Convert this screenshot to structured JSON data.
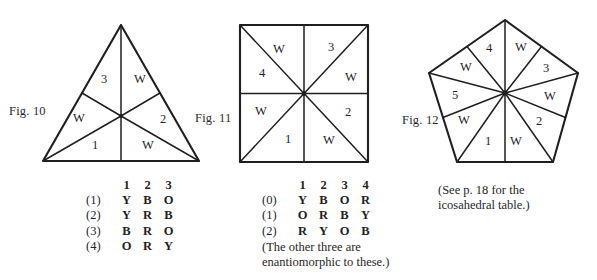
{
  "figures": {
    "fig10": {
      "label": "Fig. 10",
      "shape": "triangle",
      "cells": [
        "3",
        "W",
        "2",
        "W",
        "1",
        "W"
      ],
      "cell_positions": [
        {
          "text": "3",
          "x": 104,
          "y": 80
        },
        {
          "text": "W",
          "x": 140,
          "y": 80
        },
        {
          "text": "2",
          "x": 163,
          "y": 120
        },
        {
          "text": "W",
          "x": 148,
          "y": 146
        },
        {
          "text": "1",
          "x": 95,
          "y": 146
        },
        {
          "text": "W",
          "x": 79,
          "y": 119
        }
      ]
    },
    "fig11": {
      "label": "Fig. 11",
      "shape": "square",
      "cells": [
        "W",
        "3",
        "W",
        "2",
        "W",
        "1",
        "W",
        "4"
      ],
      "cell_positions": [
        {
          "text": "W",
          "x": 279,
          "y": 50
        },
        {
          "text": "3",
          "x": 331,
          "y": 48
        },
        {
          "text": "W",
          "x": 351,
          "y": 78
        },
        {
          "text": "2",
          "x": 348,
          "y": 113
        },
        {
          "text": "W",
          "x": 329,
          "y": 141
        },
        {
          "text": "1",
          "x": 288,
          "y": 140
        },
        {
          "text": "W",
          "x": 261,
          "y": 112
        },
        {
          "text": "4",
          "x": 262,
          "y": 74
        }
      ]
    },
    "fig12": {
      "label": "Fig. 12",
      "shape": "pentagon",
      "cells": [
        "4",
        "W",
        "3",
        "W",
        "2",
        "W",
        "1",
        "W",
        "5",
        "W"
      ],
      "cell_positions": [
        {
          "text": "4",
          "x": 489,
          "y": 49
        },
        {
          "text": "W",
          "x": 521,
          "y": 48
        },
        {
          "text": "3",
          "x": 546,
          "y": 69
        },
        {
          "text": "W",
          "x": 550,
          "y": 97
        },
        {
          "text": "2",
          "x": 539,
          "y": 122
        },
        {
          "text": "W",
          "x": 516,
          "y": 142
        },
        {
          "text": "1",
          "x": 488,
          "y": 142
        },
        {
          "text": "W",
          "x": 464,
          "y": 121
        },
        {
          "text": "5",
          "x": 455,
          "y": 96
        },
        {
          "text": "W",
          "x": 466,
          "y": 68
        }
      ]
    }
  },
  "table_triangle": {
    "columns": [
      "1",
      "2",
      "3"
    ],
    "rows": [
      {
        "label": "(1)",
        "values": [
          "Y",
          "B",
          "O"
        ]
      },
      {
        "label": "(2)",
        "values": [
          "Y",
          "R",
          "B"
        ]
      },
      {
        "label": "(3)",
        "values": [
          "B",
          "R",
          "O"
        ]
      },
      {
        "label": "(4)",
        "values": [
          "O",
          "R",
          "Y"
        ]
      }
    ]
  },
  "table_square": {
    "columns": [
      "1",
      "2",
      "3",
      "4"
    ],
    "rows": [
      {
        "label": "(0)",
        "values": [
          "Y",
          "B",
          "O",
          "R"
        ]
      },
      {
        "label": "(1)",
        "values": [
          "O",
          "R",
          "B",
          "Y"
        ]
      },
      {
        "label": "(2)",
        "values": [
          "R",
          "Y",
          "O",
          "B"
        ]
      }
    ],
    "note_line1": "(The other three are",
    "note_line2": "enantiomorphic to these.)"
  },
  "note_icosahedral": {
    "line1": "(See p. 18 for the",
    "line2": "icosahedral table.)"
  },
  "colors": {
    "ink": "#1f1f1f",
    "paper": "#ffffff"
  }
}
